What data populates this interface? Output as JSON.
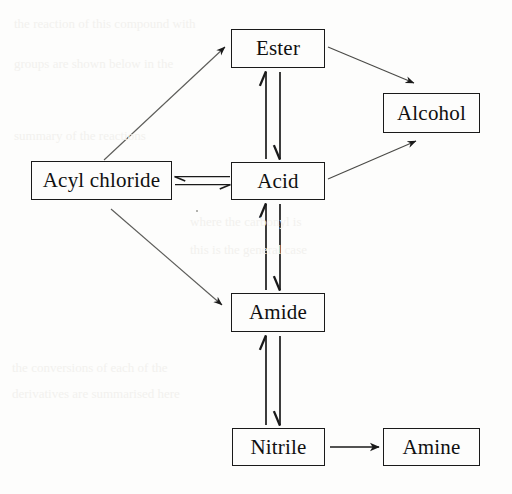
{
  "diagram": {
    "type": "flowchart",
    "background_color": "#fdfdfc",
    "line_color": "#1a1a1a",
    "text_color": "#101010",
    "nodes": [
      {
        "id": "ester",
        "label": "Ester",
        "x": 231,
        "y": 29,
        "w": 94,
        "h": 39
      },
      {
        "id": "alcohol",
        "label": "Alcohol",
        "x": 383,
        "y": 93,
        "w": 97,
        "h": 40
      },
      {
        "id": "acyl_chloride",
        "label": "Acyl chloride",
        "x": 31,
        "y": 161,
        "w": 141,
        "h": 39
      },
      {
        "id": "acid",
        "label": "Acid",
        "x": 231,
        "y": 162,
        "w": 94,
        "h": 38
      },
      {
        "id": "amide",
        "label": "Amide",
        "x": 231,
        "y": 293,
        "w": 94,
        "h": 39
      },
      {
        "id": "nitrile",
        "label": "Nitrile",
        "x": 232,
        "y": 428,
        "w": 93,
        "h": 38
      },
      {
        "id": "amine",
        "label": "Amine",
        "x": 383,
        "y": 428,
        "w": 97,
        "h": 38
      }
    ],
    "edges": [
      {
        "id": "acyl-to-ester",
        "from": "acyl_chloride",
        "to": "ester",
        "style": "single",
        "direction": "forward"
      },
      {
        "id": "acyl-to-acid",
        "from": "acyl_chloride",
        "to": "acid",
        "style": "reversible",
        "direction": "both"
      },
      {
        "id": "acyl-to-amide",
        "from": "acyl_chloride",
        "to": "amide",
        "style": "single",
        "direction": "forward"
      },
      {
        "id": "ester-acid",
        "from": "ester",
        "to": "acid",
        "style": "reversible",
        "direction": "both"
      },
      {
        "id": "ester-to-alcohol",
        "from": "ester",
        "to": "alcohol",
        "style": "single",
        "direction": "forward"
      },
      {
        "id": "acid-to-alcohol",
        "from": "acid",
        "to": "alcohol",
        "style": "single",
        "direction": "forward"
      },
      {
        "id": "acid-amide",
        "from": "acid",
        "to": "amide",
        "style": "reversible",
        "direction": "both"
      },
      {
        "id": "amide-nitrile",
        "from": "amide",
        "to": "nitrile",
        "style": "reversible",
        "direction": "both"
      },
      {
        "id": "nitrile-to-amine",
        "from": "nitrile",
        "to": "amine",
        "style": "single",
        "direction": "forward"
      }
    ]
  }
}
